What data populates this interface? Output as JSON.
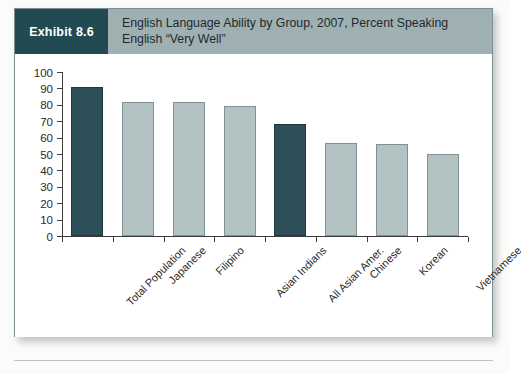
{
  "exhibit": {
    "tag": "Exhibit 8.6",
    "title_line1": "English Language Ability by Group, 2007, Percent Speaking",
    "title_line2": "English “Very Well”"
  },
  "colors": {
    "tag_background": "#214a52",
    "header_background": "#9fb0b2",
    "bar_highlight": "#2d5058",
    "bar_default": "#b3c2c2",
    "axis": "#3b3b3b"
  },
  "chart_data": {
    "type": "bar",
    "title": "English Language Ability by Group, 2007, Percent Speaking English “Very Well”",
    "xlabel": "",
    "ylabel": "",
    "ylim": [
      0,
      100
    ],
    "yticks": [
      0,
      10,
      20,
      30,
      40,
      50,
      60,
      70,
      80,
      90,
      100
    ],
    "grid": false,
    "legend": "none",
    "categories": [
      "Total Population",
      "Japanese",
      "Filipino",
      "Asian Indians",
      "All Asian Amer.",
      "Chinese",
      "Korean",
      "Vietnamese"
    ],
    "values": [
      91,
      82,
      82,
      79,
      68,
      57,
      56,
      50
    ],
    "bar_styles": [
      "dark",
      "light",
      "light",
      "light",
      "dark",
      "light",
      "light",
      "light"
    ]
  }
}
